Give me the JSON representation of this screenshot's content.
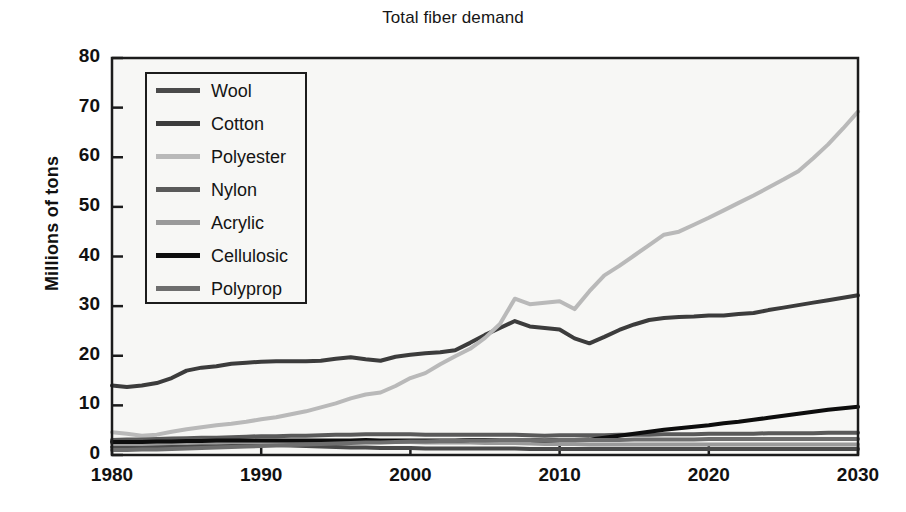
{
  "chart_data": {
    "type": "line",
    "title": "Total fiber demand",
    "xlabel": "",
    "ylabel": "Millions of tons",
    "xlim": [
      1980,
      2030
    ],
    "ylim": [
      0,
      80
    ],
    "xticks": [
      1980,
      1990,
      2000,
      2010,
      2020,
      2030
    ],
    "yticks": [
      0,
      10,
      20,
      30,
      40,
      50,
      60,
      70,
      80
    ],
    "grid": false,
    "legend_position": "upper left",
    "x": [
      1980,
      1981,
      1982,
      1983,
      1984,
      1985,
      1986,
      1987,
      1988,
      1989,
      1990,
      1991,
      1992,
      1993,
      1994,
      1995,
      1996,
      1997,
      1998,
      1999,
      2000,
      2001,
      2002,
      2003,
      2004,
      2005,
      2006,
      2007,
      2008,
      2009,
      2010,
      2011,
      2012,
      2013,
      2014,
      2015,
      2016,
      2017,
      2018,
      2019,
      2020,
      2021,
      2022,
      2023,
      2024,
      2025,
      2026,
      2027,
      2028,
      2029,
      2030
    ],
    "series": [
      {
        "name": "Wool",
        "color": "#4a4a4a",
        "values": [
          1.6,
          1.6,
          1.7,
          1.7,
          1.8,
          1.8,
          1.9,
          1.9,
          1.9,
          2.0,
          2.0,
          2.0,
          1.9,
          1.8,
          1.7,
          1.6,
          1.5,
          1.5,
          1.4,
          1.4,
          1.4,
          1.3,
          1.3,
          1.3,
          1.3,
          1.3,
          1.3,
          1.3,
          1.2,
          1.2,
          1.2,
          1.2,
          1.2,
          1.2,
          1.2,
          1.2,
          1.2,
          1.2,
          1.2,
          1.2,
          1.2,
          1.2,
          1.2,
          1.2,
          1.2,
          1.2,
          1.2,
          1.2,
          1.2,
          1.2,
          1.2
        ]
      },
      {
        "name": "Cotton",
        "color": "#3c3c3c",
        "values": [
          14.0,
          13.7,
          14.0,
          14.5,
          15.5,
          17.0,
          17.6,
          17.9,
          18.4,
          18.6,
          18.8,
          18.9,
          18.9,
          18.9,
          19.0,
          19.4,
          19.7,
          19.3,
          19.0,
          19.8,
          20.2,
          20.5,
          20.7,
          21.1,
          22.6,
          24.2,
          25.6,
          27.0,
          25.9,
          25.6,
          25.3,
          23.5,
          22.5,
          23.8,
          25.2,
          26.3,
          27.2,
          27.6,
          27.8,
          27.9,
          28.1,
          28.1,
          28.4,
          28.6,
          29.2,
          29.7,
          30.2,
          30.7,
          31.2,
          31.7,
          32.2
        ]
      },
      {
        "name": "Polyester",
        "color": "#b9b9b9",
        "values": [
          4.6,
          4.3,
          3.9,
          4.1,
          4.7,
          5.2,
          5.6,
          6.0,
          6.3,
          6.7,
          7.2,
          7.6,
          8.2,
          8.8,
          9.6,
          10.4,
          11.4,
          12.2,
          12.6,
          13.9,
          15.5,
          16.5,
          18.3,
          19.9,
          21.4,
          23.6,
          26.4,
          31.5,
          30.4,
          30.7,
          31.0,
          29.4,
          33.0,
          36.2,
          38.1,
          40.2,
          42.3,
          44.4,
          45.0,
          46.4,
          47.8,
          49.3,
          50.8,
          52.3,
          53.9,
          55.5,
          57.2,
          59.8,
          62.6,
          65.8,
          69.2
        ]
      },
      {
        "name": "Nylon",
        "color": "#5a5a5a",
        "values": [
          3.0,
          3.1,
          3.1,
          3.2,
          3.3,
          3.4,
          3.5,
          3.5,
          3.6,
          3.7,
          3.8,
          3.8,
          3.9,
          3.9,
          4.0,
          4.1,
          4.1,
          4.2,
          4.2,
          4.2,
          4.2,
          4.1,
          4.1,
          4.1,
          4.1,
          4.1,
          4.1,
          4.1,
          4.0,
          3.9,
          4.0,
          4.0,
          4.0,
          4.0,
          4.1,
          4.1,
          4.1,
          4.2,
          4.2,
          4.2,
          4.3,
          4.3,
          4.3,
          4.3,
          4.4,
          4.4,
          4.4,
          4.4,
          4.5,
          4.5,
          4.5
        ]
      },
      {
        "name": "Acrylic",
        "color": "#9a9a9a",
        "values": [
          2.2,
          2.2,
          2.2,
          2.3,
          2.4,
          2.4,
          2.5,
          2.5,
          2.6,
          2.6,
          2.6,
          2.6,
          2.6,
          2.6,
          2.6,
          2.6,
          2.6,
          2.6,
          2.6,
          2.6,
          2.6,
          2.5,
          2.5,
          2.5,
          2.5,
          2.4,
          2.4,
          2.4,
          2.3,
          2.2,
          2.2,
          2.2,
          2.1,
          2.1,
          2.1,
          2.1,
          2.1,
          2.1,
          2.1,
          2.1,
          2.1,
          2.1,
          2.1,
          2.1,
          2.1,
          2.1,
          2.1,
          2.1,
          2.1,
          2.1,
          2.1
        ]
      },
      {
        "name": "Cellulosic",
        "color": "#0d0d0d",
        "values": [
          2.6,
          2.6,
          2.6,
          2.7,
          2.7,
          2.8,
          2.8,
          2.9,
          2.9,
          2.9,
          2.9,
          2.9,
          2.9,
          2.9,
          2.9,
          2.9,
          2.9,
          3.0,
          2.9,
          2.9,
          2.9,
          2.9,
          2.9,
          2.9,
          3.0,
          3.0,
          3.0,
          3.0,
          3.0,
          2.9,
          3.0,
          3.0,
          3.1,
          3.5,
          3.9,
          4.3,
          4.7,
          5.1,
          5.4,
          5.7,
          6.0,
          6.4,
          6.7,
          7.1,
          7.5,
          7.9,
          8.3,
          8.7,
          9.1,
          9.4,
          9.7
        ]
      },
      {
        "name": "Polyprop",
        "color": "#6e6e6e",
        "values": [
          1.0,
          1.0,
          1.1,
          1.1,
          1.2,
          1.3,
          1.4,
          1.5,
          1.6,
          1.7,
          1.8,
          1.9,
          2.0,
          2.1,
          2.2,
          2.3,
          2.4,
          2.5,
          2.5,
          2.6,
          2.7,
          2.7,
          2.8,
          2.8,
          2.9,
          2.9,
          3.0,
          3.0,
          3.0,
          2.9,
          3.0,
          3.0,
          3.0,
          3.0,
          3.0,
          3.1,
          3.1,
          3.1,
          3.1,
          3.1,
          3.2,
          3.2,
          3.2,
          3.2,
          3.2,
          3.2,
          3.2,
          3.2,
          3.2,
          3.2,
          3.2
        ]
      }
    ]
  },
  "axes": {
    "frame_color": "#1c1c1c",
    "background": "#f7f7f5"
  }
}
